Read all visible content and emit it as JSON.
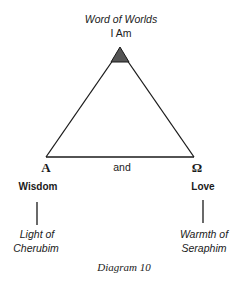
{
  "diagram": {
    "top_label": {
      "title": "Word of Worlds",
      "subtitle": "I Am"
    },
    "left_vertex": {
      "symbol": "A",
      "label": "Wisdom",
      "sub_label_line1": "Light of",
      "sub_label_line2": "Cherubim"
    },
    "right_vertex": {
      "symbol": "Ω",
      "label": "Love",
      "sub_label_line1": "Warmth of",
      "sub_label_line2": "Seraphim"
    },
    "base_label": "and",
    "caption": "Diagram 10",
    "colors": {
      "line": "#1a1a1a",
      "apex_fill": "#555555",
      "background": "#ffffff"
    }
  }
}
